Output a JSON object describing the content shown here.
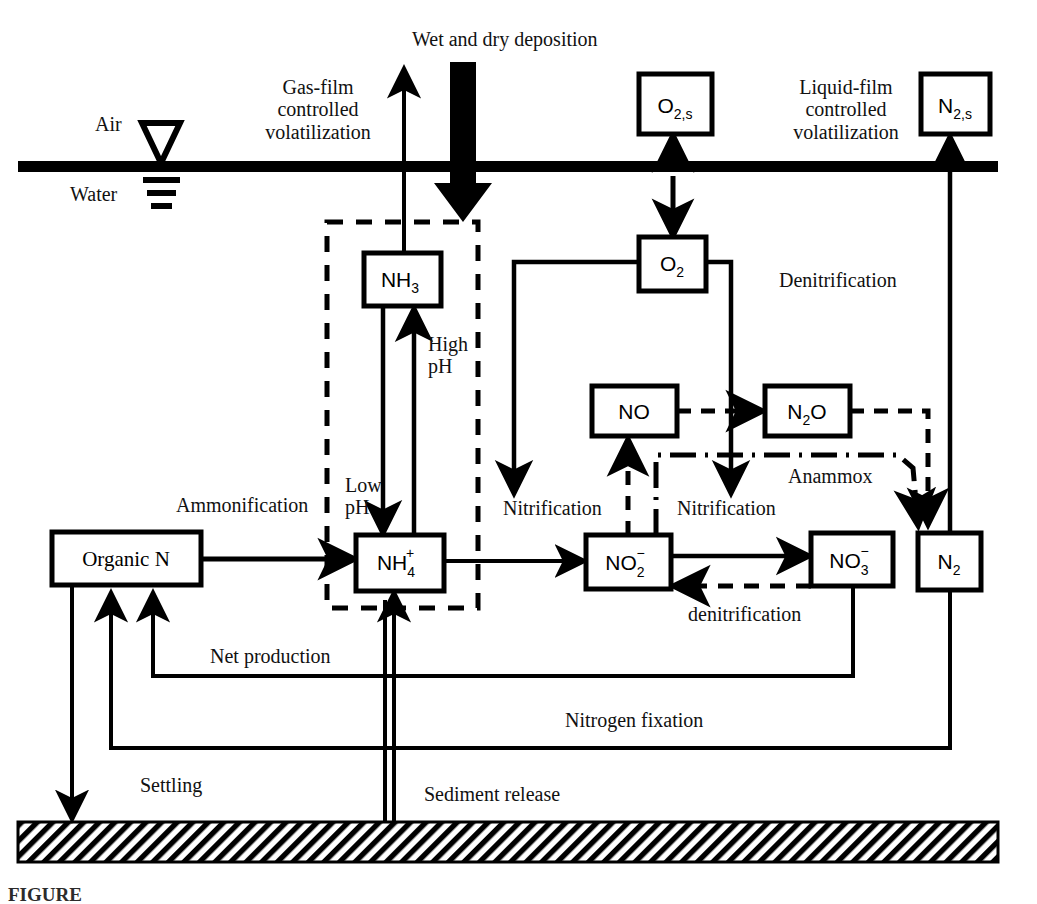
{
  "figure": {
    "domain_title": "Nitrogen cycle in a surface water body",
    "caption_partial": "FIGURE"
  },
  "zones": {
    "air_label": "Air",
    "water_label": "Water",
    "interface_color": "#000000",
    "sediment_hatch_color": "#000000"
  },
  "boxes": [
    {
      "id": "o2s",
      "label": "O",
      "sub": "2,s",
      "sup": "",
      "x": 639,
      "y": 74,
      "w": 73,
      "h": 60
    },
    {
      "id": "n2s",
      "label": "N",
      "sub": "2,s",
      "sup": "",
      "x": 921,
      "y": 74,
      "w": 69,
      "h": 60
    },
    {
      "id": "nh3",
      "label": "NH",
      "sub": "3",
      "sup": "",
      "x": 364,
      "y": 253,
      "w": 77,
      "h": 53
    },
    {
      "id": "o2",
      "label": "O",
      "sub": "2",
      "sup": "",
      "x": 639,
      "y": 237,
      "w": 67,
      "h": 54
    },
    {
      "id": "no",
      "label": "NO",
      "sub": "",
      "sup": "",
      "x": 592,
      "y": 386,
      "w": 85,
      "h": 50
    },
    {
      "id": "n2o",
      "label": "N",
      "sub": "2",
      "sup": "",
      "suffix": "O",
      "x": 765,
      "y": 386,
      "w": 85,
      "h": 50
    },
    {
      "id": "organicn",
      "label": "Organic N",
      "sub": "",
      "sup": "",
      "x": 52,
      "y": 532,
      "w": 149,
      "h": 53
    },
    {
      "id": "nh4",
      "label": "NH",
      "sub": "4",
      "sup": "+",
      "x": 356,
      "y": 535,
      "w": 88,
      "h": 56
    },
    {
      "id": "no2",
      "label": "NO",
      "sub": "2",
      "sup": "−",
      "x": 586,
      "y": 535,
      "w": 85,
      "h": 54
    },
    {
      "id": "no3",
      "label": "NO",
      "sub": "3",
      "sup": "−",
      "x": 811,
      "y": 533,
      "w": 82,
      "h": 53
    },
    {
      "id": "n2",
      "label": "N",
      "sub": "2",
      "sup": "",
      "x": 918,
      "y": 533,
      "w": 63,
      "h": 57
    }
  ],
  "box_labels": {
    "o2s": "O2,s",
    "n2s": "N2,s",
    "nh3": "NH3",
    "o2": "O2",
    "no": "NO",
    "n2o": "N2O",
    "organicn": "Organic N",
    "nh4": "NH4+",
    "no2": "NO2-",
    "no3": "NO3-",
    "n2": "N2"
  },
  "process_labels": {
    "wet_dry_deposition": "Wet and dry deposition",
    "gas_film": "Gas-film\ncontrolled\nvolatilization",
    "liquid_film": "Liquid-film\ncontrolled\nvolatilization",
    "high_ph": "High\npH",
    "low_ph": "Low\npH",
    "ammonification": "Ammonification",
    "nitrification_left": "Nitrification",
    "nitrification_right": "Nitrification",
    "denitrification_upper": "Denitrification",
    "denitrification_lower": "denitrification",
    "anammox": "Anammox",
    "net_production": "Net production",
    "nitrogen_fixation": "Nitrogen fixation",
    "settling": "Settling",
    "sediment_release": "Sediment release"
  },
  "legend_notes": {
    "dashed_box_meaning": "ammonia / ammonium equilibrium region",
    "line_styles": [
      "solid",
      "dashed",
      "dash-dot"
    ]
  }
}
